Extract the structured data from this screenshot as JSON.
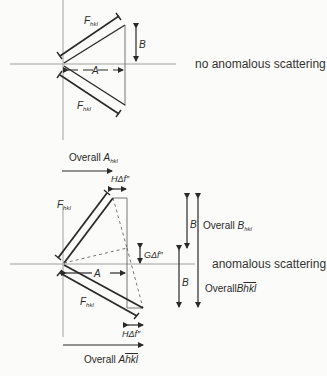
{
  "top_diagram": {
    "caption": "no anomalous scattering",
    "f_upper": {
      "main": "F",
      "sub": "hkl"
    },
    "f_lower": {
      "main": "F",
      "sub": "hkl"
    },
    "label_A": "A",
    "label_B": "B"
  },
  "bottom_diagram": {
    "caption": "anomalous scattering",
    "overall_A_hkl": {
      "text": "Overall ",
      "main": "A",
      "sub": "hkl"
    },
    "overall_A_bar": {
      "text": "Overall ",
      "main": "A",
      "bar": "hkl"
    },
    "overall_B_hkl": {
      "text": "Overall ",
      "main": "B",
      "sub": "hkl"
    },
    "overall_B_bar": {
      "text": "Overall",
      "main": "B",
      "bar": "hkl"
    },
    "h_delta_top": "HΔf″",
    "h_delta_bottom": "HΔf″",
    "g_delta": "GΔf″",
    "f_upper": {
      "main": "F",
      "sub": "hkl"
    },
    "f_lower": {
      "main": "F",
      "sub": "hkl"
    },
    "label_A": "A",
    "label_B_upper": "B",
    "label_B_lower": "B"
  },
  "colors": {
    "ink": "#2a2a2a",
    "axis": "#8a8a8a",
    "background": "#fbfbf9"
  }
}
